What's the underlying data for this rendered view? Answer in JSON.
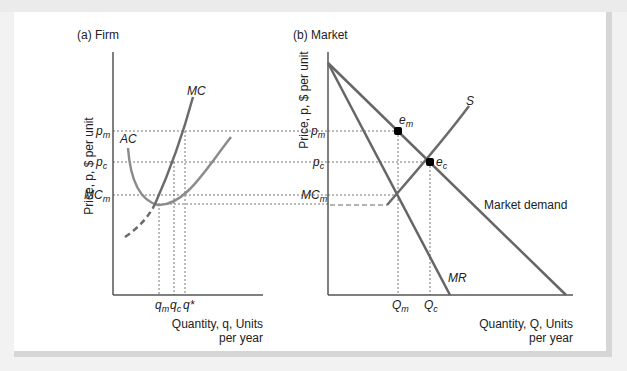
{
  "figure": {
    "panels": [
      {
        "id": "firm",
        "title": "(a) Firm",
        "y_axis_label": "Price, p, $ per unit",
        "x_axis_label_line1": "Quantity, q, Units",
        "x_axis_label_line2": "per year",
        "y_ticks": {
          "pm": "p",
          "pm_sub": "m",
          "pc": "p",
          "pc_sub": "c",
          "mcm": "MC",
          "mcm_sub": "m"
        },
        "x_ticks": {
          "qm": "q",
          "qm_sub": "m",
          "qc": "q",
          "qc_sub": "c",
          "qstar": "q*"
        },
        "curve_labels": {
          "mc": "MC",
          "ac": "AC"
        }
      },
      {
        "id": "market",
        "title": "(b) Market",
        "y_axis_label": "Price, p, $ per unit",
        "x_axis_label_line1": "Quantity, Q, Units",
        "x_axis_label_line2": "per year",
        "y_ticks": {
          "pm": "p",
          "pm_sub": "m",
          "pc": "p",
          "pc_sub": "c",
          "mcm": "MC",
          "mcm_sub": "m"
        },
        "x_ticks": {
          "qm": "Q",
          "qm_sub": "m",
          "qc": "Q",
          "qc_sub": "c"
        },
        "curve_labels": {
          "s": "S",
          "mr": "MR",
          "demand": "Market demand"
        },
        "points": {
          "em": "e",
          "em_sub": "m",
          "ec": "e",
          "ec_sub": "c"
        }
      }
    ],
    "colors": {
      "mc_curve": "#6b6b6b",
      "ac_curve": "#8c8c8c",
      "market_lines": "#666666",
      "axis": "#555555",
      "guide": "#777777",
      "point": "#000000"
    }
  }
}
